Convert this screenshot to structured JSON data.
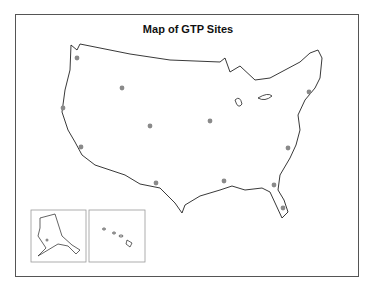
{
  "title": "Map of GTP Sites",
  "colors": {
    "dot": "#8a8a8a",
    "outline": "#222222",
    "frame": "#555555",
    "inset_border": "#999999"
  },
  "insets": [
    {
      "name": "Alaska"
    },
    {
      "name": "Hawaii"
    }
  ],
  "sites": [
    {
      "x": 77,
      "y": 58
    },
    {
      "x": 122,
      "y": 88
    },
    {
      "x": 63,
      "y": 108
    },
    {
      "x": 150,
      "y": 126
    },
    {
      "x": 81,
      "y": 147
    },
    {
      "x": 210,
      "y": 121
    },
    {
      "x": 309,
      "y": 92
    },
    {
      "x": 288,
      "y": 148
    },
    {
      "x": 156,
      "y": 183
    },
    {
      "x": 224,
      "y": 181
    },
    {
      "x": 274,
      "y": 185
    },
    {
      "x": 283,
      "y": 208
    },
    {
      "x": 47,
      "y": 240
    }
  ]
}
